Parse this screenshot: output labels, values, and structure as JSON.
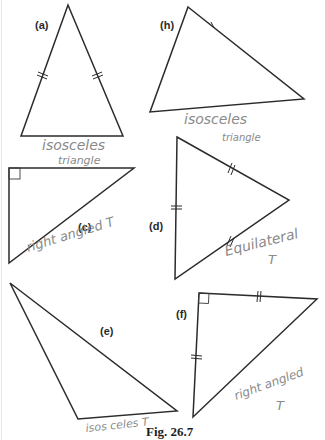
{
  "figure": {
    "caption": "Fig. 26.7",
    "colors": {
      "ink": "#2b2b2b",
      "pencil": "#8a8a8a",
      "background": "#ffffff"
    }
  },
  "triangles": [
    {
      "id": "a",
      "label": "(a)",
      "annotation_lines": [
        "isosceles",
        "triangle"
      ],
      "marks": "two equal sides (double ticks)",
      "type": "isosceles"
    },
    {
      "id": "h",
      "label": "(h)",
      "annotation_lines": [
        "isosceles",
        "triangle"
      ],
      "marks": "single tick on top edge",
      "type": "isosceles"
    },
    {
      "id": "c",
      "label": "(c)",
      "annotation_lines": [
        "right angled T"
      ],
      "marks": "right angle box",
      "type": "right-angled"
    },
    {
      "id": "d",
      "label": "(d)",
      "annotation_lines": [
        "Equilateral",
        "T"
      ],
      "marks": "three equal sides (double ticks)",
      "type": "equilateral"
    },
    {
      "id": "e",
      "label": "(e)",
      "annotation_lines": [
        "isos celes T"
      ],
      "marks": "none",
      "type": "scalene (annotated isosceles)"
    },
    {
      "id": "f",
      "label": "(f)",
      "annotation_lines": [
        "right angled",
        "T"
      ],
      "marks": "right angle box, two equal sides (double ticks)",
      "type": "right-angled isosceles"
    }
  ]
}
